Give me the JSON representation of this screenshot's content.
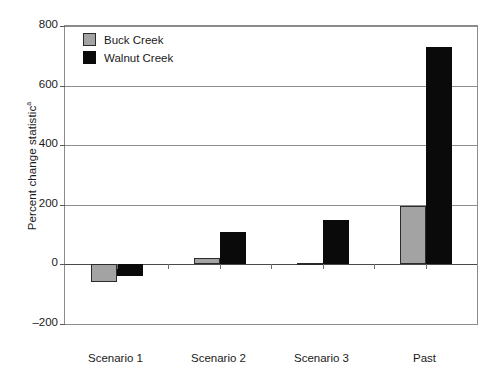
{
  "chart_data": {
    "type": "bar",
    "title": "",
    "subtitle": "",
    "xlabel": "",
    "ylabel": "Percent change statistic",
    "ylabel_superscript": "a",
    "categories": [
      "Scenario 1",
      "Scenario 2",
      "Scenario 3",
      "Past"
    ],
    "series": [
      {
        "name": "Buck Creek",
        "color": "#a3a3a3",
        "values": [
          -60,
          20,
          5,
          195
        ]
      },
      {
        "name": "Walnut Creek",
        "color": "#0a0a0a",
        "values": [
          -40,
          110,
          150,
          730
        ]
      }
    ],
    "ylim": [
      -200,
      800
    ],
    "yticks": [
      800,
      600,
      400,
      200,
      0,
      -200
    ],
    "ytick_labels": [
      "800",
      "600",
      "400",
      "200",
      "0",
      "–200"
    ],
    "grid": true,
    "grid_axis": "y",
    "legend_position": "top-left",
    "legend": [
      "Buck Creek",
      "Walnut Creek"
    ],
    "zero_line": 0,
    "frame": true
  },
  "legend": {
    "items": [
      {
        "label": "Buck Creek",
        "swatch": "buck"
      },
      {
        "label": "Walnut Creek",
        "swatch": "walnut"
      }
    ]
  },
  "colors": {
    "buck_creek": "#a3a3a3",
    "walnut_creek": "#0a0a0a",
    "gridline": "#8c8c8c",
    "frame": "#8c8c8c",
    "text": "#1a1a1a",
    "background": "#ffffff"
  }
}
